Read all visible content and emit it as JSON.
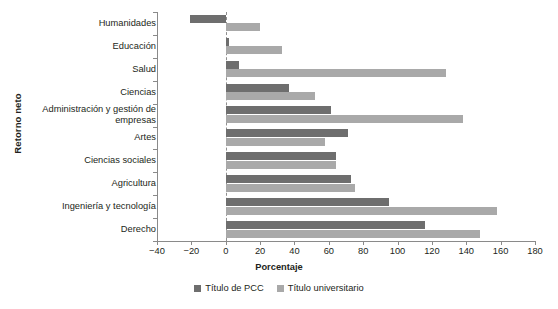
{
  "chart_data": {
    "type": "bar",
    "orientation": "horizontal",
    "title": "",
    "xlabel": "Porcentaje",
    "ylabel": "Retorno neto",
    "xlim": [
      -40,
      180
    ],
    "xticks": [
      -40,
      -20,
      0,
      20,
      40,
      60,
      80,
      100,
      120,
      140,
      160,
      180
    ],
    "xtick_labels": [
      "−40",
      "−20",
      "0",
      "20",
      "40",
      "60",
      "80",
      "100",
      "120",
      "140",
      "160",
      "180"
    ],
    "grid": false,
    "zero_line": 0,
    "legend_position": "bottom-center",
    "categories": [
      "Humanidades",
      "Educación",
      "Salud",
      "Ciencias",
      "Administración y gestión de empresas",
      "Artes",
      "Ciencias sociales",
      "Agricultura",
      "Ingeniería y tecnología",
      "Derecho"
    ],
    "series": [
      {
        "name": "Título de PCC",
        "color": "#6e6e6e",
        "values": [
          -21,
          2,
          8,
          37,
          61,
          71,
          64,
          73,
          95,
          116
        ]
      },
      {
        "name": "Título universitario",
        "color": "#a9a9a9",
        "values": [
          20,
          33,
          128,
          52,
          138,
          58,
          64,
          75,
          158,
          148
        ]
      }
    ]
  },
  "axes": {
    "y_title": "Retorno neto",
    "x_title": "Porcentaje"
  },
  "legend": {
    "items": [
      {
        "label": "Título de PCC",
        "color": "#6e6e6e"
      },
      {
        "label": "Título universitario",
        "color": "#a9a9a9"
      }
    ]
  }
}
